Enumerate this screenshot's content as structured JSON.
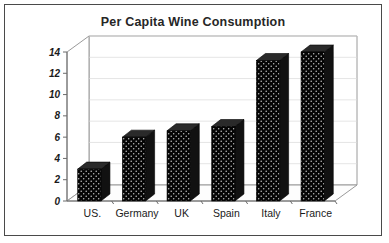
{
  "chart_data": {
    "type": "bar",
    "title": "Per Capita Wine Consumption",
    "xlabel": "",
    "ylabel": "",
    "categories": [
      "US.",
      "Germany",
      "UK",
      "Spain",
      "Italy",
      "France"
    ],
    "values": [
      3,
      6,
      6.6,
      7,
      13.2,
      14
    ],
    "yticks": [
      0,
      2,
      4,
      6,
      8,
      10,
      12,
      14
    ],
    "ylim": [
      0,
      14
    ],
    "grid": false,
    "legend": false,
    "three_d": true,
    "bar_color": "#000000",
    "bar_pattern": "speckled-dots",
    "title_color": "#262626",
    "frame_color": "#4a4a4a",
    "wall_color": "#9a9a9a"
  }
}
